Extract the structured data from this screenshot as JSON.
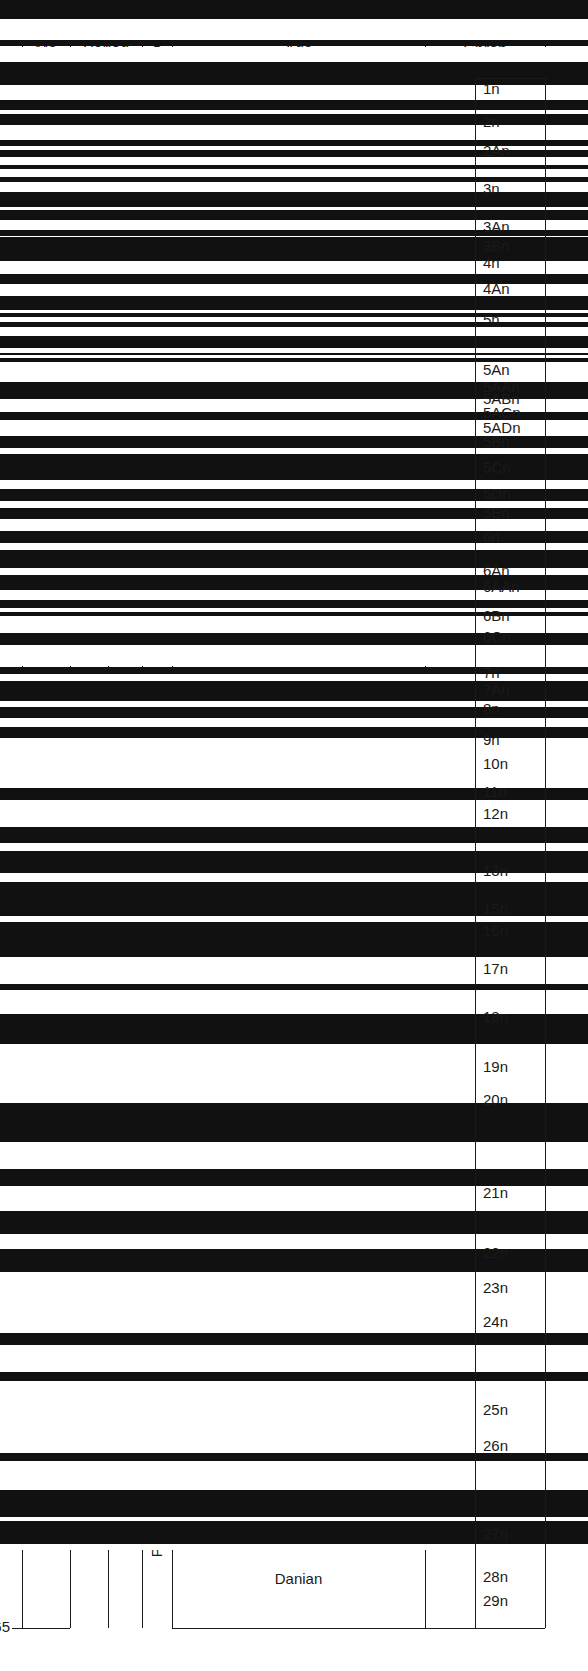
{
  "chart_data": {
    "type": "table",
    "ylabel": "Ma",
    "ylim": [
      0,
      65
    ],
    "y_inverted": true,
    "axis_ticks": [
      0,
      5,
      10,
      15,
      20,
      25,
      30,
      35,
      40,
      45,
      50,
      55,
      60,
      65
    ],
    "grid": false,
    "columns": [
      {
        "key": "ma",
        "header": "Ma"
      },
      {
        "key": "period",
        "header": "Period"
      },
      {
        "key": "epoch",
        "header": "Epoch"
      },
      {
        "key": "age",
        "header": "Age"
      },
      {
        "key": "chron",
        "header": "Chron"
      }
    ],
    "periods": [
      {
        "label": "QUATERNARY",
        "start": 0,
        "end": 1.8,
        "orientation": "horizontal"
      },
      {
        "label": "NEOGENE",
        "start": 1.8,
        "end": 23.8,
        "orientation": "vertical"
      },
      {
        "label": "PALEOGENE",
        "start": 23.8,
        "end": 65.0,
        "orientation": "vertical"
      },
      {
        "label": "TERTIARY",
        "start": 1.8,
        "end": 65.0,
        "orientation": "vertical"
      }
    ],
    "epochs": [
      {
        "label": "PLIO-\nCENE",
        "start": 1.8,
        "end": 5.3,
        "orientation": "vertical"
      },
      {
        "label": "MIOCENE",
        "start": 5.3,
        "end": 23.8,
        "orientation": "vertical"
      },
      {
        "label": "OLIGOCENE",
        "start": 23.8,
        "end": 33.7,
        "orientation": "vertical"
      },
      {
        "label": "EOCENE",
        "start": 33.7,
        "end": 54.8,
        "orientation": "vertical"
      },
      {
        "label": "PALAEOCENE",
        "start": 54.8,
        "end": 65.0,
        "orientation": "vertical"
      }
    ],
    "ages": [
      {
        "label": "Piacenzian",
        "start": 1.8,
        "end": 3.6
      },
      {
        "label": "Zanclian",
        "start": 3.6,
        "end": 5.3
      },
      {
        "label": "Messinian",
        "start": 5.3,
        "end": 7.1
      },
      {
        "label": "Tortonian",
        "start": 7.1,
        "end": 11.2
      },
      {
        "label": "Serravallian",
        "start": 11.2,
        "end": 15.9
      },
      {
        "label": "Langhian",
        "start": 15.9,
        "end": 17.0
      },
      {
        "label": "Burdigalian",
        "start": 17.0,
        "end": 21.9
      },
      {
        "label": "Aquitanian",
        "start": 21.9,
        "end": 23.8
      },
      {
        "label": "Chattian",
        "start": 23.8,
        "end": 28.5
      },
      {
        "label": "Rupelian",
        "start": 28.5,
        "end": 33.7
      },
      {
        "label": "Priabonian",
        "start": 33.7,
        "end": 37.0
      },
      {
        "label": "Bartonian",
        "start": 37.0,
        "end": 41.3
      },
      {
        "label": "Lutetian",
        "start": 41.3,
        "end": 49.0
      },
      {
        "label": "Ypresian",
        "start": 49.0,
        "end": 54.8
      },
      {
        "label": "Thanetian",
        "start": 54.8,
        "end": 60.9
      },
      {
        "label": "Danian",
        "start": 60.9,
        "end": 65.0
      }
    ],
    "chron_labels": [
      {
        "label": "1n",
        "age": 0.5
      },
      {
        "label": "2n",
        "age": 1.9
      },
      {
        "label": "2An",
        "age": 3.1
      },
      {
        "label": "3n",
        "age": 4.7
      },
      {
        "label": "3An",
        "age": 6.3
      },
      {
        "label": "3Bn",
        "age": 7.1
      },
      {
        "label": "4n",
        "age": 7.8
      },
      {
        "label": "4An",
        "age": 8.9
      },
      {
        "label": "5n",
        "age": 10.2
      },
      {
        "label": "5An",
        "age": 12.3
      },
      {
        "label": "5AAn",
        "age": 13.0
      },
      {
        "label": "5ABn",
        "age": 13.5
      },
      {
        "label": "5ACn",
        "age": 14.1
      },
      {
        "label": "5ADn",
        "age": 14.7
      },
      {
        "label": "5Bn",
        "age": 15.3
      },
      {
        "label": "5Cn",
        "age": 16.4
      },
      {
        "label": "5Dn",
        "age": 17.5
      },
      {
        "label": "5En",
        "age": 18.3
      },
      {
        "label": "6n",
        "age": 19.3
      },
      {
        "label": "6An",
        "age": 20.7
      },
      {
        "label": "6AAn",
        "age": 21.4
      },
      {
        "label": "6Bn",
        "age": 22.6
      },
      {
        "label": "6Cn",
        "age": 23.5
      },
      {
        "label": "7n",
        "age": 25.0
      },
      {
        "label": "7An",
        "age": 25.7
      },
      {
        "label": "8n",
        "age": 26.5
      },
      {
        "label": "9n",
        "age": 27.8
      },
      {
        "label": "10n",
        "age": 28.8
      },
      {
        "label": "11n",
        "age": 30.0
      },
      {
        "label": "12n",
        "age": 30.9
      },
      {
        "label": "13n",
        "age": 33.3
      },
      {
        "label": "15n",
        "age": 34.9
      },
      {
        "label": "16n",
        "age": 35.8
      },
      {
        "label": "17n",
        "age": 37.4
      },
      {
        "label": "18n",
        "age": 39.4
      },
      {
        "label": "19n",
        "age": 41.5
      },
      {
        "label": "20n",
        "age": 42.9
      },
      {
        "label": "21n",
        "age": 46.8
      },
      {
        "label": "22n",
        "age": 49.3
      },
      {
        "label": "23n",
        "age": 50.8
      },
      {
        "label": "24n",
        "age": 52.2
      },
      {
        "label": "25n",
        "age": 55.9
      },
      {
        "label": "26n",
        "age": 57.4
      },
      {
        "label": "27n",
        "age": 61.1
      },
      {
        "label": "28n",
        "age": 62.9
      },
      {
        "label": "29n",
        "age": 63.9
      }
    ],
    "chron_bands": [
      {
        "p": "n",
        "from": 0.0,
        "to": 0.78
      },
      {
        "p": "r",
        "from": 0.78,
        "to": 1.66
      },
      {
        "p": "n",
        "from": 1.66,
        "to": 1.95
      },
      {
        "p": "r",
        "from": 1.95,
        "to": 2.58
      },
      {
        "p": "n",
        "from": 2.58,
        "to": 3.58
      },
      {
        "p": "r",
        "from": 3.58,
        "to": 4.18
      },
      {
        "p": "n",
        "from": 4.18,
        "to": 4.62
      },
      {
        "p": "r",
        "from": 4.62,
        "to": 4.8
      },
      {
        "p": "n",
        "from": 4.8,
        "to": 5.23
      },
      {
        "p": "r",
        "from": 5.23,
        "to": 5.89
      },
      {
        "p": "n",
        "from": 5.89,
        "to": 6.14
      },
      {
        "p": "r",
        "from": 6.14,
        "to": 6.27
      },
      {
        "p": "n",
        "from": 6.27,
        "to": 6.57
      },
      {
        "p": "r",
        "from": 6.57,
        "to": 6.94
      },
      {
        "p": "n",
        "from": 6.94,
        "to": 7.09
      },
      {
        "p": "r",
        "from": 7.09,
        "to": 7.43
      },
      {
        "p": "n",
        "from": 7.43,
        "to": 7.65
      },
      {
        "p": "r",
        "from": 7.65,
        "to": 8.07
      },
      {
        "p": "n",
        "from": 8.07,
        "to": 8.7
      },
      {
        "p": "r",
        "from": 8.7,
        "to": 8.8
      },
      {
        "p": "n",
        "from": 8.8,
        "to": 9.23
      },
      {
        "p": "r",
        "from": 9.23,
        "to": 9.64
      },
      {
        "p": "n",
        "from": 9.64,
        "to": 9.88
      },
      {
        "p": "r",
        "from": 9.88,
        "to": 9.92
      },
      {
        "p": "n",
        "from": 9.92,
        "to": 10.95
      },
      {
        "p": "r",
        "from": 10.95,
        "to": 11.48
      },
      {
        "p": "n",
        "from": 11.48,
        "to": 11.93
      },
      {
        "p": "r",
        "from": 11.93,
        "to": 12.4
      },
      {
        "p": "n",
        "from": 12.4,
        "to": 12.99
      },
      {
        "p": "r",
        "from": 12.99,
        "to": 13.14
      },
      {
        "p": "n",
        "from": 13.14,
        "to": 13.3
      },
      {
        "p": "r",
        "from": 13.3,
        "to": 13.51
      },
      {
        "p": "n",
        "from": 13.51,
        "to": 13.7
      },
      {
        "p": "r",
        "from": 13.7,
        "to": 14.08
      },
      {
        "p": "n",
        "from": 14.08,
        "to": 14.61
      },
      {
        "p": "r",
        "from": 14.61,
        "to": 14.8
      },
      {
        "p": "n",
        "from": 14.8,
        "to": 14.89
      },
      {
        "p": "r",
        "from": 14.89,
        "to": 15.03
      },
      {
        "p": "n",
        "from": 15.03,
        "to": 15.16
      },
      {
        "p": "r",
        "from": 15.16,
        "to": 16.01
      },
      {
        "p": "n",
        "from": 16.01,
        "to": 16.73
      },
      {
        "p": "r",
        "from": 16.73,
        "to": 17.28
      },
      {
        "p": "n",
        "from": 17.28,
        "to": 17.62
      },
      {
        "p": "r",
        "from": 17.62,
        "to": 18.28
      },
      {
        "p": "n",
        "from": 18.28,
        "to": 18.78
      },
      {
        "p": "r",
        "from": 18.78,
        "to": 19.05
      },
      {
        "p": "n",
        "from": 19.05,
        "to": 20.13
      },
      {
        "p": "r",
        "from": 20.13,
        "to": 20.52
      },
      {
        "p": "n",
        "from": 20.52,
        "to": 21.02
      },
      {
        "p": "r",
        "from": 21.02,
        "to": 21.32
      },
      {
        "p": "n",
        "from": 21.32,
        "to": 21.77
      },
      {
        "p": "r",
        "from": 21.77,
        "to": 22.25
      },
      {
        "p": "n",
        "from": 22.25,
        "to": 22.76
      },
      {
        "p": "r",
        "from": 22.76,
        "to": 23.07
      },
      {
        "p": "n",
        "from": 23.07,
        "to": 23.8
      },
      {
        "p": "r",
        "from": 23.8,
        "to": 24.12
      },
      {
        "p": "n",
        "from": 24.12,
        "to": 24.73
      },
      {
        "p": "r",
        "from": 24.73,
        "to": 25.18
      },
      {
        "p": "n",
        "from": 25.18,
        "to": 25.5
      },
      {
        "p": "r",
        "from": 25.5,
        "to": 25.65
      },
      {
        "p": "n",
        "from": 25.65,
        "to": 25.82
      },
      {
        "p": "r",
        "from": 25.82,
        "to": 26.55
      },
      {
        "p": "n",
        "from": 26.55,
        "to": 27.03
      },
      {
        "p": "r",
        "from": 27.03,
        "to": 27.95
      },
      {
        "p": "n",
        "from": 27.95,
        "to": 28.28
      },
      {
        "p": "r",
        "from": 28.28,
        "to": 28.55
      },
      {
        "p": "n",
        "from": 28.55,
        "to": 29.4
      },
      {
        "p": "r",
        "from": 29.4,
        "to": 29.66
      },
      {
        "p": "n",
        "from": 29.66,
        "to": 30.1
      },
      {
        "p": "r",
        "from": 30.1,
        "to": 30.48
      },
      {
        "p": "n",
        "from": 30.48,
        "to": 30.94
      },
      {
        "p": "r",
        "from": 30.94,
        "to": 33.06
      },
      {
        "p": "n",
        "from": 33.06,
        "to": 33.55
      },
      {
        "p": "r",
        "from": 33.55,
        "to": 34.66
      },
      {
        "p": "n",
        "from": 34.66,
        "to": 35.34
      },
      {
        "p": "r",
        "from": 35.34,
        "to": 35.69
      },
      {
        "p": "n",
        "from": 35.69,
        "to": 36.62
      },
      {
        "p": "r",
        "from": 36.62,
        "to": 36.97
      },
      {
        "p": "n",
        "from": 36.97,
        "to": 38.43
      },
      {
        "p": "r",
        "from": 38.43,
        "to": 38.68
      },
      {
        "p": "n",
        "from": 38.68,
        "to": 40.13
      },
      {
        "p": "r",
        "from": 40.13,
        "to": 41.26
      },
      {
        "p": "n",
        "from": 41.26,
        "to": 41.52
      },
      {
        "p": "r",
        "from": 41.52,
        "to": 42.54
      },
      {
        "p": "n",
        "from": 42.54,
        "to": 43.79
      },
      {
        "p": "r",
        "from": 43.79,
        "to": 46.26
      },
      {
        "p": "n",
        "from": 46.26,
        "to": 47.91
      },
      {
        "p": "r",
        "from": 47.91,
        "to": 49.04
      },
      {
        "p": "n",
        "from": 49.04,
        "to": 49.72
      },
      {
        "p": "r",
        "from": 49.72,
        "to": 50.78
      },
      {
        "p": "n",
        "from": 50.78,
        "to": 51.74
      },
      {
        "p": "r",
        "from": 51.74,
        "to": 52.36
      },
      {
        "p": "n",
        "from": 52.36,
        "to": 53.35
      },
      {
        "p": "r",
        "from": 53.35,
        "to": 55.9
      },
      {
        "p": "n",
        "from": 55.9,
        "to": 56.39
      },
      {
        "p": "r",
        "from": 56.39,
        "to": 57.55
      },
      {
        "p": "n",
        "from": 57.55,
        "to": 57.91
      },
      {
        "p": "r",
        "from": 57.91,
        "to": 60.92
      },
      {
        "p": "n",
        "from": 60.92,
        "to": 61.28
      },
      {
        "p": "r",
        "from": 61.28,
        "to": 62.5
      },
      {
        "p": "n",
        "from": 62.5,
        "to": 63.63
      },
      {
        "p": "r",
        "from": 63.63,
        "to": 63.78
      },
      {
        "p": "n",
        "from": 63.78,
        "to": 64.75
      },
      {
        "p": "r",
        "from": 64.75,
        "to": 65.0
      }
    ]
  },
  "header": {
    "ma": "Ma",
    "period": "Period",
    "epoch": "Epoch",
    "age": "Age",
    "chron": "Chron"
  },
  "colors": {
    "line": "#1a1a1a",
    "normal_polarity": "#111111",
    "reversed_polarity": "#ffffff",
    "background": "#ffffff"
  }
}
